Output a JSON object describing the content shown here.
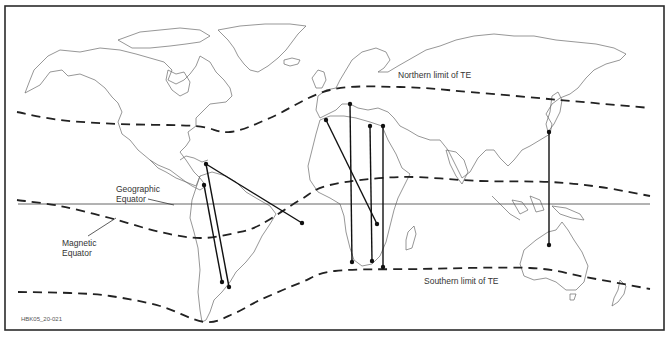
{
  "labels": {
    "northern_limit": "Northern limit of TE",
    "southern_limit": "Southern limit of TE",
    "geographic_equator_line1": "Geographic",
    "geographic_equator_line2": "Equator",
    "magnetic_equator_line1": "Magnetic",
    "magnetic_equator_line2": "Equator",
    "figure_id": "HBK05_20-021"
  },
  "colors": {
    "background": "#ffffff",
    "lines": "#111111",
    "coastline": "#6a6a6a"
  },
  "map": {
    "frame": {
      "x": 5,
      "y": 6,
      "width": 659,
      "height": 324
    },
    "geographic_equator": {
      "y": 204,
      "x1": 18,
      "x2": 650
    },
    "northern_limit_points": [
      [
        17,
        112
      ],
      [
        60,
        120
      ],
      [
        120,
        124
      ],
      [
        195,
        126
      ],
      [
        230,
        132
      ],
      [
        270,
        118
      ],
      [
        330,
        90
      ],
      [
        400,
        87
      ],
      [
        470,
        92
      ],
      [
        560,
        100
      ],
      [
        650,
        108
      ]
    ],
    "magnetic_equator_points": [
      [
        17,
        200
      ],
      [
        60,
        206
      ],
      [
        110,
        218
      ],
      [
        160,
        232
      ],
      [
        200,
        238
      ],
      [
        235,
        233
      ],
      [
        260,
        225
      ],
      [
        300,
        200
      ],
      [
        330,
        185
      ],
      [
        400,
        177
      ],
      [
        480,
        181
      ],
      [
        550,
        182
      ],
      [
        600,
        187
      ],
      [
        650,
        196
      ]
    ],
    "southern_limit_points": [
      [
        18,
        292
      ],
      [
        70,
        293
      ],
      [
        110,
        296
      ],
      [
        160,
        306
      ],
      [
        205,
        322
      ],
      [
        235,
        313
      ],
      [
        260,
        300
      ],
      [
        300,
        283
      ],
      [
        335,
        271
      ],
      [
        420,
        269
      ],
      [
        530,
        268
      ],
      [
        585,
        277
      ],
      [
        650,
        289
      ]
    ],
    "propagation_paths": [
      {
        "from": [
          206,
          164
        ],
        "to": [
          302,
          223
        ],
        "from_dot": false
      },
      {
        "from": [
          206,
          164
        ],
        "to": [
          229,
          287
        ],
        "from_dot": true
      },
      {
        "from": [
          204,
          185
        ],
        "to": [
          222,
          282
        ],
        "from_dot": true
      },
      {
        "from": [
          326,
          120
        ],
        "to": [
          377,
          224
        ],
        "from_dot": true
      },
      {
        "from": [
          350,
          104
        ],
        "to": [
          352,
          262
        ],
        "from_dot": true
      },
      {
        "from": [
          370,
          126
        ],
        "to": [
          372,
          261
        ],
        "from_dot": true
      },
      {
        "from": [
          383,
          126
        ],
        "to": [
          383,
          267
        ],
        "from_dot": true
      },
      {
        "from": [
          549,
          132
        ],
        "to": [
          549,
          245
        ],
        "from_dot": true
      }
    ]
  }
}
